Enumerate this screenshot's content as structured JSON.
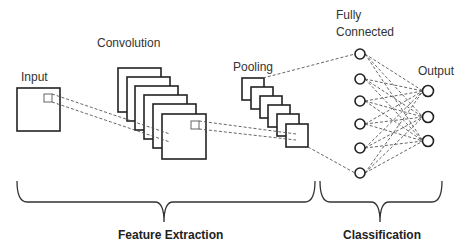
{
  "diagram": {
    "stages": {
      "input": {
        "label": "Input"
      },
      "convolution": {
        "label": "Convolution",
        "feature_maps": 6
      },
      "pooling": {
        "label": "Pooling",
        "feature_maps": 6
      },
      "fully_connected": {
        "label_line1": "Fully",
        "label_line2": "Connected",
        "nodes": 6
      },
      "output": {
        "label": "Output",
        "nodes": 3
      }
    },
    "groups": {
      "feature_extraction": {
        "label": "Feature Extraction"
      },
      "classification": {
        "label": "Classification"
      }
    },
    "colors": {
      "stroke": "#222222",
      "dashed": "#555555",
      "background": "#ffffff"
    }
  }
}
